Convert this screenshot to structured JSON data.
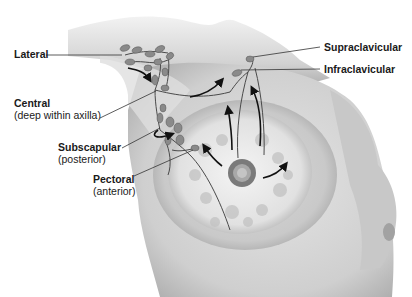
{
  "figure": {
    "labels": {
      "lateral": {
        "title": "Lateral",
        "subtitle": ""
      },
      "central": {
        "title": "Central",
        "subtitle": "(deep within axilla)"
      },
      "subscapular": {
        "title": "Subscapular",
        "subtitle": "(posterior)"
      },
      "pectoral": {
        "title": "Pectoral",
        "subtitle": "(anterior)"
      },
      "supraclavicular": {
        "title": "Supraclavicular",
        "subtitle": ""
      },
      "infraclavicular": {
        "title": "Infraclavicular",
        "subtitle": ""
      }
    },
    "colors": {
      "skin_light": "#e6e6e6",
      "skin_mid": "#c8c8c8",
      "skin_shadow": "#9a9a9a",
      "node_fill": "#8a8a8a",
      "vessel": "#4a4a4a",
      "arrow": "#111111",
      "areola": "#7a7a7a",
      "leader_line": "#333333",
      "text": "#1a1a1a"
    }
  }
}
